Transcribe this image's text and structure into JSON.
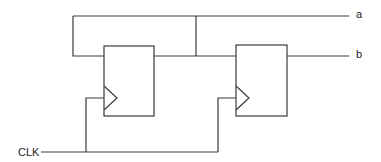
{
  "diagram": {
    "type": "circuit-schematic",
    "labels": {
      "clock": "CLK",
      "output_a": "a",
      "output_b": "b"
    },
    "components": [
      {
        "id": "ff1",
        "kind": "flip-flop",
        "has_clock_input": true
      },
      {
        "id": "ff2",
        "kind": "flip-flop",
        "has_clock_input": true
      }
    ],
    "connections": [
      {
        "from": "ff1.Q",
        "to": "ff2.D"
      },
      {
        "from": "ff1.Q",
        "to": "a"
      },
      {
        "from": "a",
        "to": "ff1.D",
        "note": "feedback loop"
      },
      {
        "from": "ff2.Q",
        "to": "b"
      },
      {
        "from": "CLK",
        "to": "ff1.clk"
      },
      {
        "from": "CLK",
        "to": "ff2.clk"
      }
    ],
    "colors": {
      "line": "#3a3a3a",
      "text": "#222222",
      "background": "#ffffff"
    }
  }
}
